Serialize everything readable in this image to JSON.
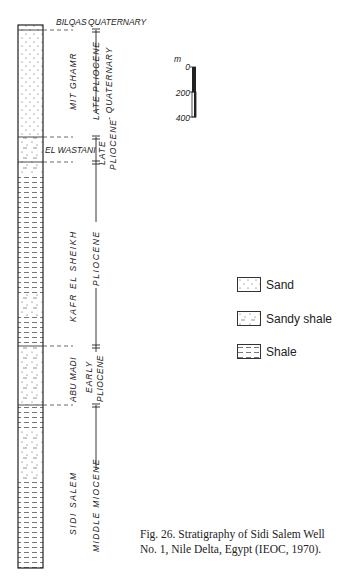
{
  "column": {
    "top": 25,
    "bottom": 568,
    "left": 18,
    "right": 43,
    "units": [
      {
        "name": "BILQAS",
        "age": "QUATERNARY",
        "top": 25,
        "bottom": 30,
        "lithology": "sand"
      },
      {
        "name": "MIT GHAMR",
        "age": "LATE PLIOCENE - QUATERNARY",
        "top": 30,
        "bottom": 137,
        "lithology": "sand"
      },
      {
        "name": "EL WASTANI",
        "age": "LATE PLIOCENE",
        "top": 137,
        "bottom": 162,
        "lithology": "sandy_shale"
      },
      {
        "name": "KAFR EL SHEIKH",
        "age": "PLIOCENE",
        "top": 162,
        "bottom": 346,
        "lithology": "shale"
      },
      {
        "name": "ABU MADI",
        "age": "EARLY PLIOCENE",
        "top": 346,
        "bottom": 405,
        "lithology": "sandy_shale"
      },
      {
        "name": "SIDI SALEM",
        "age": "MIDDLE MIOCENE",
        "top": 405,
        "bottom": 568,
        "lithology": "shale"
      }
    ]
  },
  "labels": {
    "bilqas": "BILQAS",
    "quaternary": "QUATERNARY",
    "mit_ghamr": "MIT GHAMR",
    "late_pliocene_1": "LATE PLIOCENE",
    "quaternary_2": "- QUATERNARY",
    "el_wastani": "EL WASTANI",
    "late": "LATE",
    "pliocene_1": "PLIOCENE",
    "kafr_el_sheikh": "KAFR EL SHEIKH",
    "pliocene_2": "PLIOCENE",
    "abu_madi": "ABU MADI",
    "early": "EARLY",
    "pliocene_3": "PLIOCENE",
    "sidi_salem": "SIDI SALEM",
    "middle_miocene": "MIDDLE MIOCENE"
  },
  "scale": {
    "unit": "m",
    "ticks": [
      "0",
      "200",
      "400"
    ]
  },
  "legend": [
    {
      "label": "Sand",
      "pattern": "sand"
    },
    {
      "label": "Sandy shale",
      "pattern": "sandy_shale"
    },
    {
      "label": "Shale",
      "pattern": "shale"
    }
  ],
  "caption": {
    "line1": "Fig. 26. Stratigraphy of Sidi Salem Well",
    "line2": "No. 1, Nile Delta, Egypt (IEOC, 1970)."
  }
}
